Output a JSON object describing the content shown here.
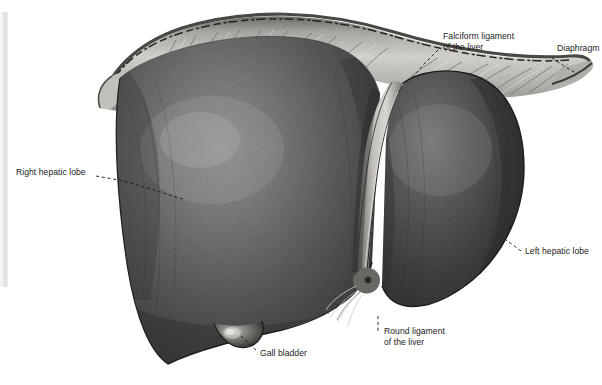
{
  "figure": {
    "kind": "anatomical-illustration",
    "style": "grayscale stipple engraving",
    "palette": {
      "background": "#ffffff",
      "liver_dark": "#3a3a3a",
      "liver_mid": "#5c5c5c",
      "liver_light": "#8d8d8d",
      "liver_highlight": "#a8a8a8",
      "diaphragm_light": "#d9d7d2",
      "diaphragm_mid": "#b4b2ad",
      "diaphragm_dark": "#5e5c58",
      "ligament_pale": "#cfcdc7",
      "gallbladder": "#6e6c68",
      "label_text": "#1a1a1a",
      "leader_line": "#1a1a1a",
      "edge_strip": "#e3e3e3"
    }
  },
  "labels": [
    {
      "id": "falciform-ligament",
      "name": "falciform-ligament-label",
      "lines": [
        "Falciform ligament",
        "of the liver"
      ],
      "x": 443,
      "y": 36,
      "leader": {
        "type": "dashed-diagonal",
        "points": "438,50 422,66 412,78"
      }
    },
    {
      "id": "diaphragm",
      "name": "diaphragm-label",
      "lines": [
        "Diaphragm"
      ],
      "clipped_at_right_edge": true,
      "x": 557,
      "y": 48,
      "leader": {
        "type": "dashed-diagonal",
        "points": "554,58 566,66 576,73"
      }
    },
    {
      "id": "right-hepatic-lobe",
      "name": "right-hepatic-lobe-label",
      "lines": [
        "Right hepatic lobe"
      ],
      "x": 16,
      "y": 171,
      "leader": {
        "type": "dashed-diagonal",
        "points": "96,176 120,180 160,192 183,199"
      }
    },
    {
      "id": "left-hepatic-lobe",
      "name": "left-hepatic-lobe-label",
      "lines": [
        "Left hepatic lobe"
      ],
      "x": 524,
      "y": 250,
      "leader": {
        "type": "dashed-diagonal",
        "points": "520,252 512,246 506,241"
      }
    },
    {
      "id": "gall-bladder",
      "name": "gall-bladder-label",
      "lines": [
        "Gall bladder"
      ],
      "x": 259,
      "y": 352,
      "leader": {
        "type": "dashed-diagonal",
        "points": "255,350 246,341 240,335"
      }
    },
    {
      "id": "round-ligament",
      "name": "round-ligament-label",
      "lines": [
        "Round ligament",
        "of the liver"
      ],
      "x": 384,
      "y": 330,
      "leader": {
        "type": "dashed-vertical",
        "points": "378,318 378,330"
      }
    }
  ],
  "structures": [
    {
      "id": "right-lobe",
      "name": "right-hepatic-lobe-shape"
    },
    {
      "id": "left-lobe",
      "name": "left-hepatic-lobe-shape"
    },
    {
      "id": "diaphragm",
      "name": "diaphragm-shape"
    },
    {
      "id": "falciform",
      "name": "falciform-ligament-shape"
    },
    {
      "id": "round-lig",
      "name": "round-ligament-shape"
    },
    {
      "id": "gallbladder",
      "name": "gall-bladder-shape"
    }
  ]
}
